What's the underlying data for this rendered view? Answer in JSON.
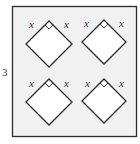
{
  "figure": {
    "side_length_label": "3",
    "variable_label": "x",
    "colors": {
      "square_fill": "#f1f1f1",
      "stroke": "#2b2b2b",
      "diamond_fill": "#ffffff",
      "text": "#333333"
    },
    "outer_square": {
      "x": 12,
      "y": 6,
      "width": 125,
      "height": 131
    },
    "diamonds": [
      {
        "id": "top-left",
        "cx": 49,
        "top": 21,
        "half": 23,
        "label_left": "x",
        "label_right": "x"
      },
      {
        "id": "top-right",
        "cx": 104,
        "top": 20,
        "half": 22,
        "label_left": "x",
        "label_right": "x"
      },
      {
        "id": "bottom-left",
        "cx": 49,
        "top": 79,
        "half": 23,
        "label_left": "x",
        "label_right": "x"
      },
      {
        "id": "bottom-right",
        "cx": 104,
        "top": 79,
        "half": 22,
        "label_left": "x",
        "label_right": "x"
      }
    ]
  }
}
